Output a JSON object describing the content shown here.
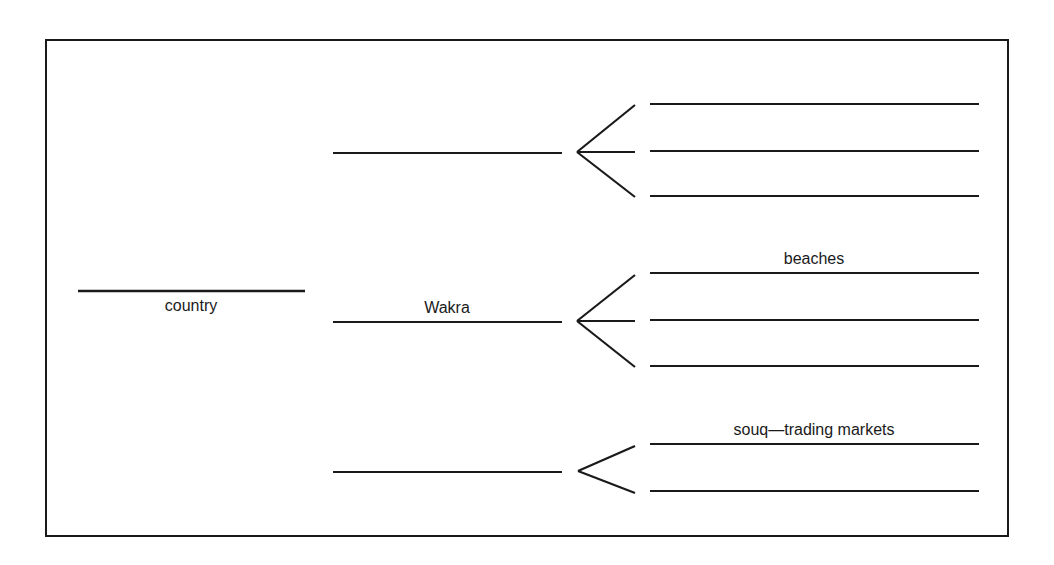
{
  "diagram": {
    "type": "tree-organizer",
    "colors": {
      "line": "#1a1a1a",
      "background": "#ffffff",
      "text": "#1a1a1a"
    },
    "frame": {
      "x": 46,
      "y": 40,
      "width": 962,
      "height": 496
    },
    "root": {
      "label": "country",
      "line": {
        "x1": 78,
        "x2": 305,
        "y": 291
      },
      "label_pos": {
        "x": 191,
        "y": 311,
        "placement": "below"
      }
    },
    "branches": [
      {
        "label": "",
        "line": {
          "x1": 333,
          "x2": 562,
          "y": 153
        },
        "bracket": {
          "vx": 577,
          "vy": 152,
          "tx": 635,
          "top": 105,
          "bottom": 197,
          "middle": true
        },
        "leaves": [
          {
            "label": "",
            "y": 104
          },
          {
            "label": "",
            "y": 151
          },
          {
            "label": "",
            "y": 196
          }
        ]
      },
      {
        "label": "Wakra",
        "line": {
          "x1": 333,
          "x2": 562,
          "y": 322
        },
        "label_pos": {
          "x": 447,
          "y": 313,
          "placement": "above"
        },
        "bracket": {
          "vx": 577,
          "vy": 321,
          "tx": 635,
          "top": 275,
          "bottom": 367,
          "middle": true
        },
        "leaves": [
          {
            "label": "beaches",
            "y": 273
          },
          {
            "label": "",
            "y": 320
          },
          {
            "label": "",
            "y": 366
          }
        ]
      },
      {
        "label": "",
        "line": {
          "x1": 333,
          "x2": 562,
          "y": 472
        },
        "bracket": {
          "vx": 578,
          "vy": 471,
          "tx": 635,
          "top": 446,
          "bottom": 493,
          "middle": false
        },
        "leaves": [
          {
            "label": "souq—trading markets",
            "y": 444
          },
          {
            "label": "",
            "y": 491
          }
        ]
      }
    ],
    "leaf_line": {
      "x1": 650,
      "x2": 979
    },
    "text": {
      "root_label": "country",
      "branch_2_label": "Wakra",
      "leaf_2_1_label": "beaches",
      "leaf_3_1_label": "souq—trading markets"
    }
  }
}
